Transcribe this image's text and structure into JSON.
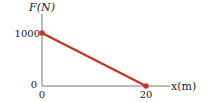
{
  "chart_data": {
    "type": "line",
    "title": "",
    "xlabel": "x(m)",
    "ylabel": "F(N)",
    "xlim": [
      0,
      20
    ],
    "ylim": [
      0,
      1000
    ],
    "x_ticks": [
      "0",
      "20"
    ],
    "y_ticks": [
      "0",
      "1000"
    ],
    "grid": false,
    "series": [
      {
        "name": "F",
        "x": [
          0,
          20
        ],
        "y": [
          1000,
          0
        ],
        "color": "#c0392b"
      }
    ]
  }
}
